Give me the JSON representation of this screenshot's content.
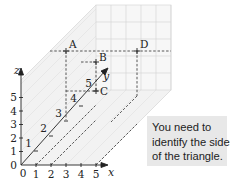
{
  "diagram": {
    "type": "3d-coordinate-grid",
    "axes": {
      "x": {
        "label": "x",
        "ticks": [
          "0",
          "1",
          "2",
          "3",
          "4",
          "5"
        ]
      },
      "y": {
        "label": "y",
        "ticks": [
          "1",
          "2",
          "3",
          "4",
          "5"
        ]
      },
      "z": {
        "label": "z",
        "ticks": [
          "0",
          "1",
          "2",
          "3",
          "4",
          "5"
        ]
      }
    },
    "points": [
      {
        "label": "A"
      },
      {
        "label": "B"
      },
      {
        "label": "C"
      },
      {
        "label": "D"
      }
    ],
    "colors": {
      "axis": "#222222",
      "grid": "#d8d8d8",
      "dashed": "#444444",
      "callout_bg": "#e8e8e8"
    }
  },
  "callout": {
    "lines": [
      "You need to",
      "identify the sides",
      "of the triangle."
    ]
  }
}
